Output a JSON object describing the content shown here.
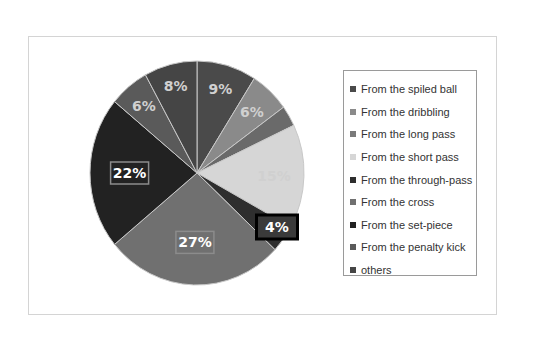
{
  "chart_data": {
    "type": "pie",
    "title": "",
    "categories": [
      "From the spiled ball",
      "From the dribbling",
      "From the long pass",
      "From the short pass",
      "From the through-pass",
      "From the cross",
      "From the set-piece",
      "From the penalty kick",
      "others"
    ],
    "values": [
      9,
      6,
      3,
      15,
      4,
      27,
      22,
      6,
      8
    ],
    "labels": [
      "9%",
      "6%",
      "",
      "15%",
      "4%",
      "27%",
      "22%",
      "6%",
      "8%"
    ],
    "colors": [
      "#4a4a4a",
      "#8a8a8a",
      "#6a6a6a",
      "#d6d6d6",
      "#2e2e2e",
      "#707070",
      "#222222",
      "#5a5a5a",
      "#454545"
    ],
    "highlighted_label": "4%",
    "legend_position": "right",
    "start_angle": 0,
    "direction": "clockwise"
  },
  "legend": {
    "items": [
      {
        "label": "From the spiled ball",
        "color": "#4a4a4a"
      },
      {
        "label": "From the dribbling",
        "color": "#8a8a8a"
      },
      {
        "label": "From the long pass",
        "color": "#7a7a7a"
      },
      {
        "label": "From the short pass",
        "color": "#d6d6d6"
      },
      {
        "label": "From the through-pass",
        "color": "#2e2e2e"
      },
      {
        "label": "From the cross",
        "color": "#707070"
      },
      {
        "label": "From the set-piece",
        "color": "#222222"
      },
      {
        "label": "From the penalty kick",
        "color": "#5a5a5a"
      },
      {
        "label": "others",
        "color": "#454545"
      }
    ]
  }
}
